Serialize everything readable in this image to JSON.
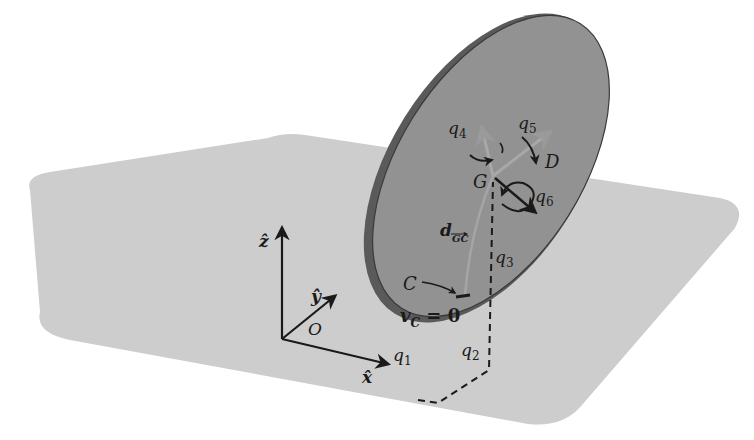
{
  "figure": {
    "colors": {
      "background": "#ffffff",
      "plane": "#cdcdcd",
      "disk_face": "#8e8e8e",
      "disk_rim": "#3a3a3a",
      "axis": "#1a1a1a",
      "faint_axis": "#a8a8a8"
    }
  },
  "frame": {
    "z_label": "ẑ",
    "y_label": "ŷ",
    "x_label": "x̂",
    "origin_label": "O"
  },
  "coordinates": {
    "q1": "q",
    "q1_sub": "1",
    "q2": "q",
    "q2_sub": "2",
    "q3": "q",
    "q3_sub": "3",
    "q4": "q",
    "q4_sub": "4",
    "q5": "q",
    "q5_sub": "5",
    "q6": "q",
    "q6_sub": "6"
  },
  "points": {
    "center_label": "G",
    "contact_label": "C",
    "disk_label": "D"
  },
  "annotations": {
    "distance_label": "d",
    "distance_sub": "GC",
    "velocity_label": "v",
    "velocity_sub": "C",
    "velocity_eq": " = 0"
  }
}
